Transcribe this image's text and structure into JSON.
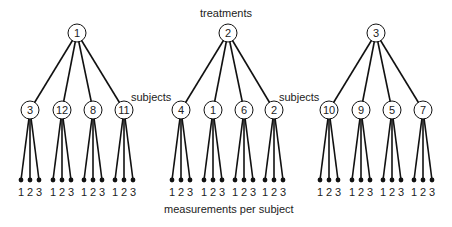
{
  "labels": {
    "treatments": "treatments",
    "subjects": "subjects",
    "measurements": "measurements per subject"
  },
  "treatments": [
    {
      "id": "1",
      "x": 77,
      "subjects": [
        {
          "id": "3",
          "x": 30
        },
        {
          "id": "12",
          "x": 62
        },
        {
          "id": "8",
          "x": 93
        },
        {
          "id": "11",
          "x": 124
        }
      ]
    },
    {
      "id": "2",
      "x": 228,
      "subjects": [
        {
          "id": "4",
          "x": 181
        },
        {
          "id": "1",
          "x": 213
        },
        {
          "id": "6",
          "x": 244
        },
        {
          "id": "2",
          "x": 274
        }
      ]
    },
    {
      "id": "3",
      "x": 376,
      "subjects": [
        {
          "id": "10",
          "x": 329
        },
        {
          "id": "9",
          "x": 361
        },
        {
          "id": "5",
          "x": 392
        },
        {
          "id": "7",
          "x": 423
        }
      ]
    }
  ],
  "measurements": [
    "1",
    "2",
    "3"
  ],
  "layout": {
    "treatment_y": 33,
    "subject_y": 110,
    "leaf_y": 180,
    "digit_y": 196,
    "node_r": 9,
    "leaf_spread": 9
  },
  "colors": {
    "line": "#111111",
    "node_fill": "#ffffff",
    "text": "#222222"
  }
}
